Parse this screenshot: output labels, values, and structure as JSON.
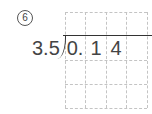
{
  "problem": {
    "number_label": "6",
    "divisor": "3.5",
    "dividend_digits": [
      "0.",
      "1",
      "4",
      ""
    ],
    "grid": {
      "columns": 4,
      "rows": 4
    }
  }
}
